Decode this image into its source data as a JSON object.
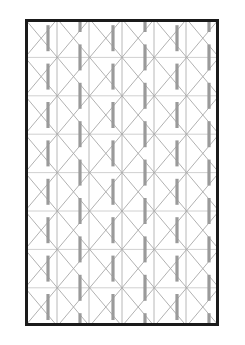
{
  "document": {
    "kind": "technical-lattice-drawing",
    "background_color": "#ffffff",
    "canvas": {
      "width": 245,
      "height": 345
    }
  },
  "frame": {
    "label": "Panel outline",
    "x": 25,
    "y": 19,
    "width": 194,
    "height": 307,
    "stroke_color": "#1a1a1a",
    "stroke_width": 3,
    "fill_color": "#ffffff"
  },
  "lattice": {
    "label": "Triangular lattice grid",
    "line_color": "#b0b0b0",
    "line_width": 0.9,
    "vertical_line_count": 7,
    "vertical_x": [
      25,
      57,
      89,
      122,
      154,
      186,
      219
    ],
    "row_count": 8,
    "row_height": 38.4,
    "row_y": [
      19,
      57.4,
      95.8,
      134.2,
      172.6,
      211,
      249.4,
      287.8,
      326.2
    ],
    "diagonal_color": "#a8a8a8",
    "diagonal_width": 0.9
  },
  "bars": {
    "label": "Gray stud segments",
    "color": "#9a9a9a",
    "width": 3.2,
    "length": 26,
    "columns_x": [
      48,
      80,
      113,
      145,
      177,
      209
    ],
    "stagger_offset_y": 19.2,
    "count": 48
  },
  "colors": {
    "page": "#ffffff",
    "frame_stroke": "#1a1a1a",
    "grid_line": "#b0b0b0",
    "diagonal_line": "#a8a8a8",
    "bar_fill": "#9a9a9a"
  }
}
